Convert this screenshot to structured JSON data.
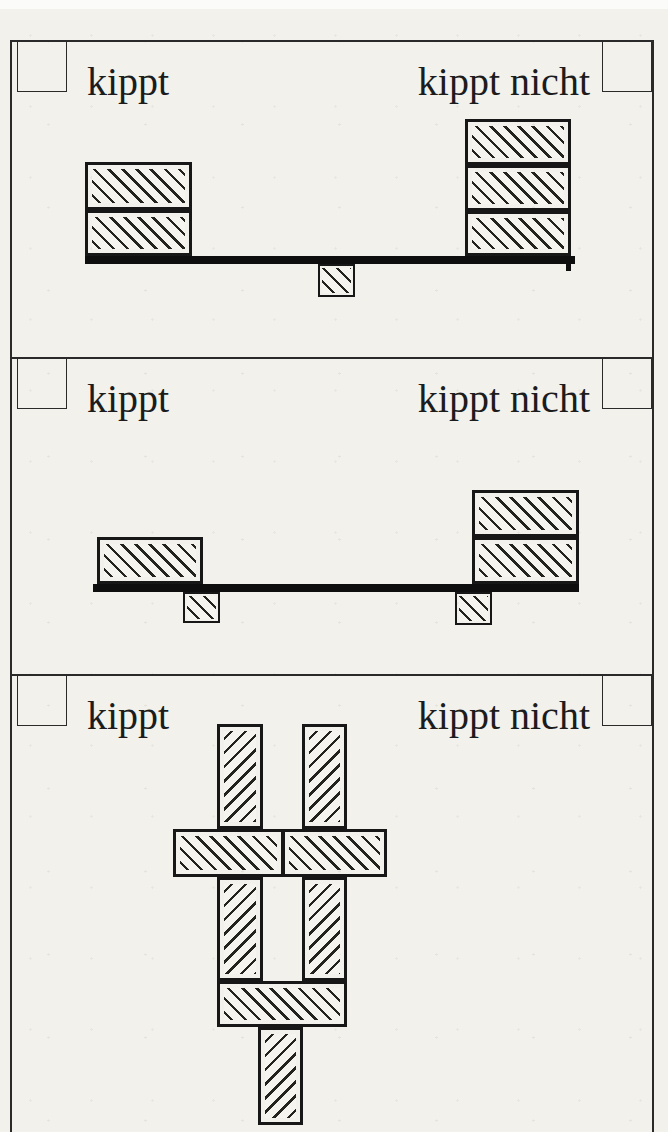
{
  "page": {
    "paper_color": "#f2f1ec",
    "ink_color": "#1c1c1c"
  },
  "panels": [
    {
      "id": 1,
      "label_left": "kippt",
      "label_right": "kippt nicht",
      "figure": {
        "shapes": [
          {
            "kind": "beam",
            "x": 85,
            "y": 256,
            "w": 490,
            "h": 8
          },
          {
            "kind": "stub",
            "x": 566,
            "y": 256,
            "w": 5,
            "h": 15
          },
          {
            "kind": "block",
            "x": 85,
            "y": 162,
            "w": 107,
            "h": 48,
            "hatch": "fwd"
          },
          {
            "kind": "block",
            "x": 85,
            "y": 210,
            "w": 107,
            "h": 46,
            "hatch": "fwd"
          },
          {
            "kind": "block",
            "x": 465,
            "y": 119,
            "w": 106,
            "h": 46,
            "hatch": "fwd"
          },
          {
            "kind": "block",
            "x": 465,
            "y": 165,
            "w": 106,
            "h": 46,
            "hatch": "fwd"
          },
          {
            "kind": "block",
            "x": 465,
            "y": 211,
            "w": 106,
            "h": 45,
            "hatch": "fwd"
          },
          {
            "kind": "pivot",
            "x": 318,
            "y": 264,
            "w": 37,
            "h": 33,
            "hatch": "fwd"
          }
        ]
      }
    },
    {
      "id": 2,
      "label_left": "kippt",
      "label_right": "kippt nicht",
      "figure": {
        "shapes": [
          {
            "kind": "beam",
            "x": 93,
            "y": 584,
            "w": 486,
            "h": 8
          },
          {
            "kind": "block",
            "x": 97,
            "y": 537,
            "w": 106,
            "h": 47,
            "hatch": "fwd"
          },
          {
            "kind": "block",
            "x": 472,
            "y": 490,
            "w": 107,
            "h": 47,
            "hatch": "fwd"
          },
          {
            "kind": "block",
            "x": 472,
            "y": 537,
            "w": 107,
            "h": 47,
            "hatch": "fwd"
          },
          {
            "kind": "pivot",
            "x": 183,
            "y": 592,
            "w": 37,
            "h": 31,
            "hatch": "fwd"
          },
          {
            "kind": "pivot",
            "x": 455,
            "y": 592,
            "w": 37,
            "h": 33,
            "hatch": "fwd"
          }
        ]
      }
    },
    {
      "id": 3,
      "label_left": "kippt",
      "label_right": "kippt nicht",
      "figure": {
        "shapes": [
          {
            "kind": "block",
            "x": 217,
            "y": 724,
            "w": 46,
            "h": 105,
            "hatch": "back"
          },
          {
            "kind": "block",
            "x": 302,
            "y": 724,
            "w": 45,
            "h": 105,
            "hatch": "back"
          },
          {
            "kind": "block",
            "x": 173,
            "y": 829,
            "w": 111,
            "h": 48,
            "hatch": "fwd"
          },
          {
            "kind": "block",
            "x": 282,
            "y": 829,
            "w": 105,
            "h": 48,
            "hatch": "fwd"
          },
          {
            "kind": "block",
            "x": 217,
            "y": 877,
            "w": 46,
            "h": 104,
            "hatch": "back"
          },
          {
            "kind": "block",
            "x": 302,
            "y": 877,
            "w": 45,
            "h": 104,
            "hatch": "back"
          },
          {
            "kind": "block",
            "x": 217,
            "y": 981,
            "w": 130,
            "h": 46,
            "hatch": "fwd"
          },
          {
            "kind": "block",
            "x": 258,
            "y": 1027,
            "w": 45,
            "h": 98,
            "hatch": "back"
          }
        ]
      }
    }
  ]
}
